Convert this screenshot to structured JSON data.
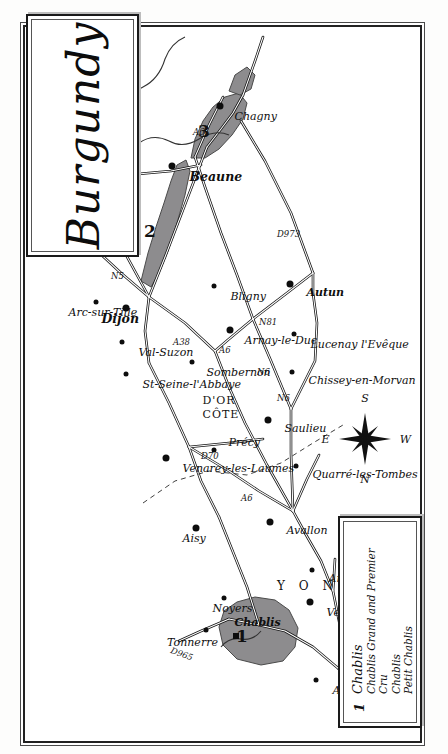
{
  "title": {
    "text": "Burgundy"
  },
  "legend": {
    "number": "1",
    "name": "Chablis",
    "lines": [
      "Chablis Grand and Premier Cru",
      "Chablis",
      "Petit Chablis"
    ]
  },
  "compass": {
    "n": "N",
    "e": "E",
    "s": "S",
    "w": "W"
  },
  "colors": {
    "wine_region_fill": "#8d8c8e",
    "wine_region_stroke": "#4a4a4a",
    "frame": "#1a1a1a",
    "road": "#141414",
    "paper": "#ffffff"
  },
  "zones": [
    {
      "number": "1",
      "label": "Chablis"
    },
    {
      "number": "2",
      "label": ""
    },
    {
      "number": "3",
      "label": ""
    }
  ],
  "departments": [
    {
      "name": "Y O N N E"
    },
    {
      "name": "CÔTE"
    },
    {
      "name": "D'OR"
    }
  ],
  "rivers": [
    {
      "name": "SAÔNE"
    }
  ],
  "roads": [
    {
      "name": "D965"
    },
    {
      "name": "A6"
    },
    {
      "name": "D70"
    },
    {
      "name": "A38"
    },
    {
      "name": "N5"
    },
    {
      "name": "A6"
    },
    {
      "name": "N6"
    },
    {
      "name": "N6"
    },
    {
      "name": "N81"
    },
    {
      "name": "D973"
    },
    {
      "name": "A6"
    }
  ],
  "places": [
    {
      "name": "Tonnerre"
    },
    {
      "name": "Chablis"
    },
    {
      "name": "Noyers"
    },
    {
      "name": "Aisy"
    },
    {
      "name": "Auxerre"
    },
    {
      "name": "Vermenton"
    },
    {
      "name": "Arcy"
    },
    {
      "name": "Avallon"
    },
    {
      "name": "Quarré-les-Tombes"
    },
    {
      "name": "Saulieu"
    },
    {
      "name": "Précy"
    },
    {
      "name": "Venarey-les-Laumes"
    },
    {
      "name": "St-Seine-l'Abbaye"
    },
    {
      "name": "Val-Suzon"
    },
    {
      "name": "Arc-sur-Tille"
    },
    {
      "name": "Dijon"
    },
    {
      "name": "Genlis"
    },
    {
      "name": "Sombernon"
    },
    {
      "name": "Arnay-le-Duc"
    },
    {
      "name": "Bligny"
    },
    {
      "name": "Beaune"
    },
    {
      "name": "Chagny"
    },
    {
      "name": "Chissey-en-Morvan"
    },
    {
      "name": "Lucenay l'Evêque"
    },
    {
      "name": "Autun"
    }
  ]
}
